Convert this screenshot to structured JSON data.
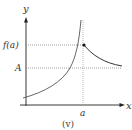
{
  "diagram": {
    "caption": "(v)",
    "axes": {
      "x_label": "x",
      "y_label": "y"
    },
    "ticks": {
      "x_tick_label": "a",
      "y_tick_labels": [
        "f(a)",
        "A"
      ]
    },
    "colors": {
      "axis": "#222222",
      "curve": "#444444",
      "guide": "#999999"
    }
  }
}
